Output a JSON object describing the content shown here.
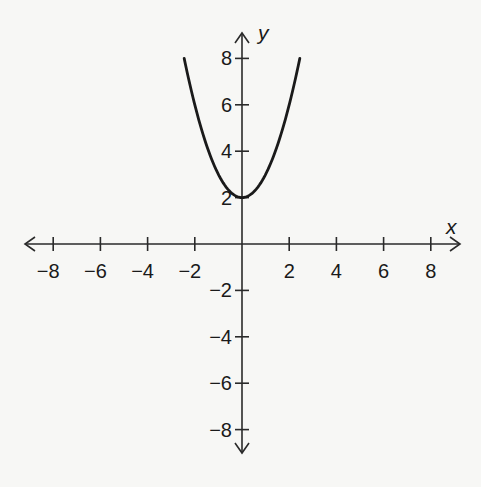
{
  "chart_data": {
    "type": "line",
    "title": "",
    "xlabel": "x",
    "ylabel": "y",
    "xlim": [
      -9,
      9
    ],
    "ylim": [
      -9,
      9
    ],
    "grid": false,
    "x_ticks": [
      -8,
      -6,
      -4,
      -2,
      2,
      4,
      6,
      8
    ],
    "y_ticks": [
      8,
      6,
      4,
      2,
      -2,
      -4,
      -6,
      -8
    ],
    "x_tick_labels": [
      "−8",
      "−6",
      "−4",
      "−2",
      "2",
      "4",
      "6",
      "8"
    ],
    "y_tick_labels": [
      "8",
      "6",
      "4",
      "2",
      "−2",
      "−4",
      "−6",
      "−8"
    ],
    "series": [
      {
        "name": "parabola",
        "equation": "y = x^2 + 2",
        "vertex": [
          0,
          2
        ],
        "x_range": [
          -2.45,
          2.45
        ],
        "points": [
          [
            -2.45,
            8
          ],
          [
            -2,
            6
          ],
          [
            -1,
            3
          ],
          [
            0,
            2
          ],
          [
            1,
            3
          ],
          [
            2,
            6
          ],
          [
            2.45,
            8
          ]
        ],
        "color": "#1a1a1a"
      }
    ],
    "axis_color": "#2a2a2a",
    "background": "#f7f7f5"
  }
}
